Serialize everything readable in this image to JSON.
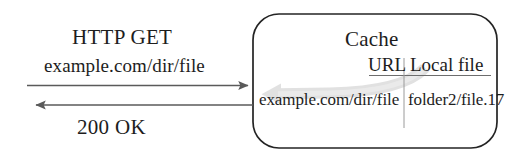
{
  "diagram": {
    "client_side": {
      "request": {
        "method_label": "HTTP GET",
        "url_label": "example.com/dir/file"
      },
      "response": {
        "status_label": "200 OK"
      }
    },
    "cache": {
      "title": "Cache",
      "table": {
        "columns": [
          "URL",
          "Local file"
        ],
        "rows": [
          {
            "url": "example.com/dir/file",
            "local_file": "folder2/file.17"
          }
        ]
      }
    },
    "arrows": {
      "request_arrow": "arrow-right",
      "response_arrow": "arrow-left",
      "lookup_arrow": "curved-arrow-left"
    },
    "colors": {
      "ink": "#1d1d1d",
      "line": "#555555",
      "lookup_arrow": "#cfcfcf",
      "background": "#ffffff"
    }
  }
}
